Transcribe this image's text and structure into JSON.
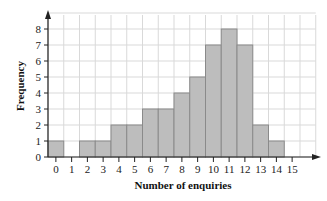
{
  "chart_data": {
    "type": "bar",
    "title": "",
    "xlabel": "Number of enquiries",
    "ylabel": "Frequency",
    "categories": [
      "0",
      "1",
      "2",
      "3",
      "4",
      "5",
      "6",
      "7",
      "8",
      "9",
      "10",
      "11",
      "12",
      "13",
      "14",
      "15"
    ],
    "values": [
      1,
      0,
      1,
      1,
      2,
      2,
      3,
      3,
      4,
      5,
      7,
      8,
      7,
      2,
      1,
      0
    ],
    "y_ticks": [
      "0",
      "1",
      "2",
      "3",
      "4",
      "5",
      "6",
      "7",
      "8"
    ],
    "ylim": [
      0,
      9
    ],
    "grid": true,
    "bar_color": "#bdbdbd",
    "bar_edge_color": "#8a8a8a",
    "grid_color": "#d9d9d9"
  }
}
